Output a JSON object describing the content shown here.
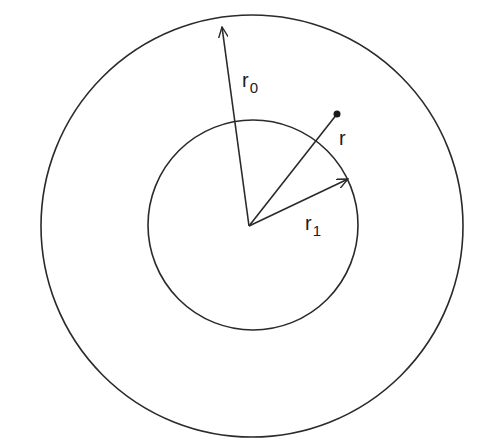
{
  "diagram": {
    "type": "concentric-circles",
    "stroke_color": "#2a2a2a",
    "background": "#ffffff",
    "center": {
      "x": 249,
      "y": 226
    },
    "outer_circle": {
      "radius": 212
    },
    "inner_circle": {
      "radius": 104
    },
    "labels": {
      "r0_main": "r",
      "r0_sub": "0",
      "r1_main": "r",
      "r1_sub": "1",
      "r_main": "r"
    },
    "point": {
      "x": 337,
      "y": 114
    }
  }
}
